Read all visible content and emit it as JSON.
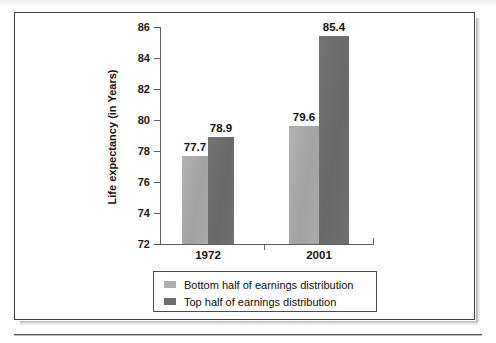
{
  "chart_data": {
    "type": "bar",
    "title": "",
    "xlabel": "",
    "ylabel": "Life expectancy (in Years)",
    "categories": [
      "1972",
      "2001"
    ],
    "series": [
      {
        "name": "Bottom half of earnings distribution",
        "values": [
          77.7,
          79.6
        ],
        "color": "#a9a9a9"
      },
      {
        "name": "Top half of earnings distribution",
        "values": [
          78.9,
          85.4
        ],
        "color": "#6f6f6f"
      }
    ],
    "value_labels": [
      [
        "77.7",
        "79.6"
      ],
      [
        "78.9",
        "85.4"
      ]
    ],
    "ylim": [
      72,
      86
    ],
    "yticks": [
      "72",
      "74",
      "76",
      "78",
      "80",
      "82",
      "84",
      "86"
    ],
    "grid": false,
    "legend_position": "bottom"
  },
  "legend": {
    "items": [
      {
        "label": "Bottom half of earnings distribution",
        "swatch": "light"
      },
      {
        "label": "Top half of earnings distribution",
        "swatch": "dark"
      }
    ]
  },
  "colors": {
    "series_light": "#a9a9a9",
    "series_dark": "#6f6f6f",
    "axis": "#5d5d5d",
    "frame": "#3d3d3d",
    "text": "#111111"
  }
}
